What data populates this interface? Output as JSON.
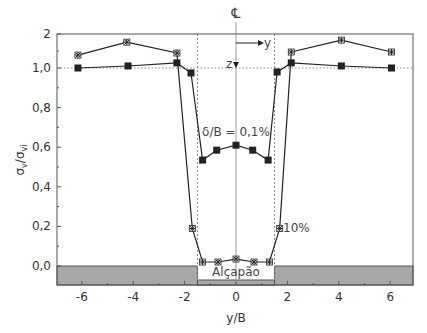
{
  "chart_data": {
    "type": "line",
    "title": "",
    "xlabel": "y/B",
    "ylabel": "σv/σvi",
    "ylabel_main": "σ",
    "ylabel_sub1": "v",
    "ylabel_slash": "/σ",
    "ylabel_sub2": "vi",
    "xlim": [
      -7,
      7
    ],
    "ylim": [
      -0.1,
      2
    ],
    "y_axis_break": "scale compressed above 1,0 (1,0 to 2)",
    "x_ticks": [
      -6,
      -4,
      -2,
      0,
      2,
      4,
      6
    ],
    "x_tick_labels": [
      "-6",
      "-4",
      "-2",
      "0",
      "2",
      "4",
      "6"
    ],
    "y_ticks": [
      0.0,
      0.2,
      0.4,
      0.6,
      0.8,
      1.0,
      2
    ],
    "y_tick_labels": [
      "0,0",
      "0,2",
      "0,4",
      "0,6",
      "0,8",
      "1,0",
      "2"
    ],
    "grid": false,
    "reference_lines": {
      "horizontal_dotted_at": 1.0,
      "vertical_dotted_at": [
        -1.5,
        1.5
      ],
      "vertical_centerline_at": 0
    },
    "series": [
      {
        "name": "δ/B = 0,1%",
        "marker": "square",
        "x": [
          -6.15,
          -4.2,
          -2.3,
          -1.75,
          -1.3,
          -0.75,
          0,
          0.65,
          1.25,
          1.6,
          2.15,
          4.1,
          6.05
        ],
        "y": [
          1.0,
          1.06,
          1.15,
          0.975,
          0.535,
          0.585,
          0.61,
          0.585,
          0.535,
          0.98,
          1.15,
          1.06,
          1.0
        ]
      },
      {
        "name": "10%",
        "marker": "star",
        "x": [
          -6.15,
          -4.25,
          -2.3,
          -1.7,
          -1.3,
          -0.7,
          0,
          0.7,
          1.3,
          1.7,
          2.15,
          4.1,
          6.05
        ],
        "y": [
          1.38,
          1.76,
          1.44,
          0.19,
          0.02,
          0.02,
          0.035,
          0.02,
          0.02,
          0.19,
          1.47,
          1.82,
          1.47
        ]
      }
    ],
    "annotations": [
      {
        "text": "δ/B = 0,1%",
        "x": 0,
        "y": 0.66
      },
      {
        "text": "10%",
        "x": 2.1,
        "y": 0.2
      },
      {
        "text": "Alçapão",
        "x": 0,
        "y": -0.04
      },
      {
        "text": "℄",
        "x": 0,
        "y": 2.1
      },
      {
        "text": "y",
        "note": "axis arrow label, pointing right"
      },
      {
        "text": "z",
        "note": "axis arrow label, pointing down"
      }
    ],
    "regions": [
      {
        "name": "soil-left",
        "x": [
          -7,
          -1.5
        ],
        "y": [
          -0.1,
          0.0
        ],
        "color": "#a8a8a8"
      },
      {
        "name": "soil-right",
        "x": [
          1.5,
          7
        ],
        "y": [
          -0.1,
          0.0
        ],
        "color": "#a8a8a8"
      },
      {
        "name": "trapdoor",
        "x": [
          -1.5,
          1.5
        ],
        "y": [
          -0.1,
          -0.075
        ],
        "color": "#a8a8a8",
        "label": "Alçapão"
      }
    ]
  },
  "labels": {
    "centerline": "℄",
    "arrow_y": "y",
    "arrow_z": "z",
    "series1": "δ/B = 0,1%",
    "series2": "10%",
    "trapdoor": "Alçapão",
    "xlabel": "y/B"
  },
  "colors": {
    "line": "#222222",
    "axis": "#555555",
    "soil": "#a8a8a8",
    "soil_border": "#555555",
    "dotted": "#888888"
  }
}
